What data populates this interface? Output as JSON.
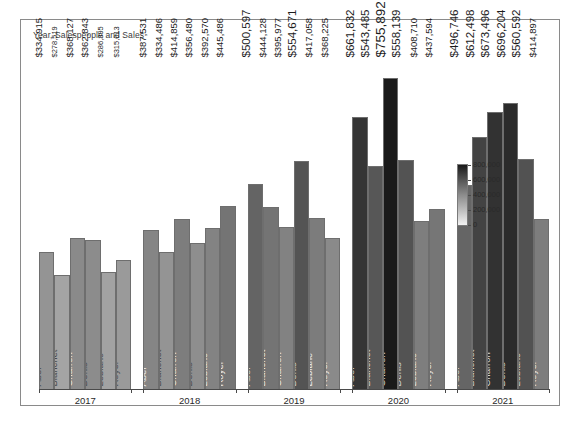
{
  "chart": {
    "title": "Year, Salespeople and Sales"
  },
  "colorbar": {
    "ticks": [
      "800,000",
      "600,000",
      "400,000",
      "200,000",
      "0"
    ],
    "min_color": "#f2f2f2",
    "max_color": "#1a1a1a",
    "vmin": 0,
    "vmax": 800000
  },
  "chart_data": {
    "type": "bar",
    "title": "Year, Salespeople and Sales",
    "xlabel": "",
    "ylabel": "",
    "grid": false,
    "legend": "colorbar-right",
    "color_scale": {
      "type": "sequential-gray",
      "vmin": 0,
      "vmax": 800000,
      "ticks": [
        0,
        200000,
        400000,
        600000,
        800000
      ]
    },
    "categories": [
      "2017",
      "2018",
      "2019",
      "2020",
      "2021"
    ],
    "salespeople": [
      "Abel",
      "Blanchet",
      "Charron",
      "Denis",
      "Leblanc",
      "Royer"
    ],
    "ylim": [
      0,
      800000
    ],
    "groups": [
      {
        "year": "2017",
        "bars": [
          {
            "name": "Abel",
            "value": 334915,
            "label": "$334,915"
          },
          {
            "name": "Blanchet",
            "value": 278519,
            "label": "$278,519"
          },
          {
            "name": "Charron",
            "value": 368127,
            "label": "$368,127"
          },
          {
            "name": "Denis",
            "value": 362843,
            "label": "$362,843"
          },
          {
            "name": "Leblanc",
            "value": 286395,
            "label": "$286,395"
          },
          {
            "name": "Royer",
            "value": 315013,
            "label": "$315,013"
          }
        ]
      },
      {
        "year": "2018",
        "bars": [
          {
            "name": "Abel",
            "value": 387531,
            "label": "$387,531"
          },
          {
            "name": "Blanchet",
            "value": 334486,
            "label": "$334,486"
          },
          {
            "name": "Charron",
            "value": 414859,
            "label": "$414,859"
          },
          {
            "name": "Denis",
            "value": 356480,
            "label": "$356,480"
          },
          {
            "name": "Leblanc",
            "value": 392570,
            "label": "$392,570"
          },
          {
            "name": "Royer",
            "value": 445486,
            "label": "$445,486"
          }
        ]
      },
      {
        "year": "2019",
        "bars": [
          {
            "name": "Abel",
            "value": 500597,
            "label": "$500,597"
          },
          {
            "name": "Blanchet",
            "value": 444128,
            "label": "$444,128"
          },
          {
            "name": "Charron",
            "value": 395977,
            "label": "$395,977"
          },
          {
            "name": "Denis",
            "value": 554671,
            "label": "$554,671"
          },
          {
            "name": "Leblanc",
            "value": 417058,
            "label": "$417,058"
          },
          {
            "name": "Royer",
            "value": 368225,
            "label": "$368,225"
          }
        ]
      },
      {
        "year": "2020",
        "bars": [
          {
            "name": "Abel",
            "value": 661832,
            "label": "$661,832"
          },
          {
            "name": "Blanchet",
            "value": 543485,
            "label": "$543,485"
          },
          {
            "name": "Charron",
            "value": 755892,
            "label": "$755,892"
          },
          {
            "name": "Denis",
            "value": 558139,
            "label": "$558,139"
          },
          {
            "name": "Leblanc",
            "value": 408710,
            "label": "$408,710"
          },
          {
            "name": "Royer",
            "value": 437594,
            "label": "$437,594"
          }
        ]
      },
      {
        "year": "2021",
        "bars": [
          {
            "name": "Abel",
            "value": 496746,
            "label": "$496,746"
          },
          {
            "name": "Blanchet",
            "value": 612498,
            "label": "$612,498"
          },
          {
            "name": "Charron",
            "value": 673496,
            "label": "$673,496"
          },
          {
            "name": "Denis",
            "value": 696204,
            "label": "$696,204"
          },
          {
            "name": "Leblanc",
            "value": 560592,
            "label": "$560,592"
          },
          {
            "name": "Royer",
            "value": 414897,
            "label": "$414,897"
          }
        ]
      }
    ]
  }
}
